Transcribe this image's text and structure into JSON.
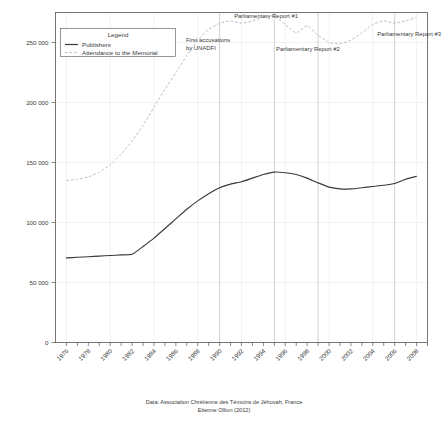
{
  "figure": {
    "name": "jehovahs-witnesses-france-line-chart",
    "background_color": "#ffffff"
  },
  "caption": {
    "line1": "Data: Association Chrétienne des Témoins de Jéhovah, France",
    "line2": "Etienne Ollion (2012)"
  },
  "legend": {
    "title": "Legend",
    "entries": [
      {
        "label": "Publishers",
        "style": "solid",
        "color": "#3a3a3a"
      },
      {
        "label": "Attendance to the Memorial",
        "style": "dashed",
        "color": "#bdbdbd"
      }
    ]
  },
  "annotations": [
    {
      "label": "First accusations\nby UNADFI",
      "line1": "First accusations",
      "line2": "by UNADFI",
      "year": 1990
    },
    {
      "label": "Parliamentary Report #1",
      "line1": "Parliamentary Report #1",
      "line2": "",
      "year": 1995
    },
    {
      "label": "Parliamentary Report #2",
      "line1": "Parliamentary Report #2",
      "line2": "",
      "year": 1999
    },
    {
      "label": "Parliamentary Report #3",
      "line1": "Parliamentary Report #3",
      "line2": "",
      "year": 2006
    }
  ],
  "chart_data": {
    "type": "line",
    "title": "",
    "subtitle": "",
    "xlabel": "",
    "ylabel": "",
    "xlim": [
      1975,
      2009
    ],
    "ylim": [
      0,
      275000
    ],
    "grid": true,
    "legend_position": "top-left-inside",
    "ytick_values": [
      0,
      50000,
      100000,
      150000,
      200000,
      250000
    ],
    "ytick_labels": [
      "0",
      "50 000",
      "100 000",
      "150 000",
      "200 000",
      "250 000"
    ],
    "xtick_values": [
      1976,
      1978,
      1980,
      1982,
      1984,
      1986,
      1988,
      1990,
      1992,
      1994,
      1996,
      1998,
      2000,
      2002,
      2004,
      2006,
      2008
    ],
    "xtick_labels": [
      "1976",
      "1978",
      "1980",
      "1982",
      "1984",
      "1986",
      "1988",
      "1990",
      "1992",
      "1994",
      "1996",
      "1998",
      "2000",
      "2002",
      "2004",
      "2006",
      "2008"
    ],
    "x": [
      1976,
      1977,
      1978,
      1979,
      1980,
      1981,
      1982,
      1983,
      1984,
      1985,
      1986,
      1987,
      1988,
      1989,
      1990,
      1991,
      1992,
      1993,
      1994,
      1995,
      1996,
      1997,
      1998,
      1999,
      2000,
      2001,
      2002,
      2003,
      2004,
      2005,
      2006,
      2007,
      2008
    ],
    "series": [
      {
        "name": "Publishers",
        "style": "solid",
        "color": "#3a3a3a",
        "values": [
          70500,
          71000,
          71500,
          72000,
          72500,
          73000,
          73500,
          80000,
          87000,
          95000,
          103000,
          111000,
          118000,
          124000,
          129000,
          132000,
          134000,
          137000,
          140000,
          142000,
          141500,
          140000,
          137000,
          133000,
          129500,
          128000,
          128000,
          129000,
          130000,
          131000,
          132500,
          136000,
          138500
        ]
      },
      {
        "name": "Attendance to the Memorial",
        "style": "dashed",
        "color": "#bdbdbd",
        "values": [
          135000,
          136000,
          138000,
          142000,
          148000,
          157000,
          168000,
          181000,
          196000,
          211000,
          225000,
          239000,
          252000,
          261000,
          266000,
          268000,
          266000,
          268000,
          271000,
          272000,
          265000,
          258000,
          264000,
          256000,
          250000,
          249000,
          252000,
          258000,
          265000,
          268000,
          266000,
          268000,
          271000
        ]
      }
    ]
  }
}
